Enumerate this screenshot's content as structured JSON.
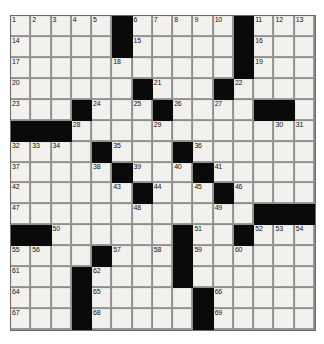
{
  "puzzle": {
    "type": "crossword-grid",
    "rows": 15,
    "cols": 15,
    "cell_fill_color": "#f2f1ee",
    "block_color": "#0a0a0a",
    "grid_line_color": "#8f8f8f",
    "background_color": "#ffffff",
    "max_clue_number": 69,
    "blocks": [
      [
        0,
        5
      ],
      [
        0,
        11
      ],
      [
        1,
        5
      ],
      [
        1,
        11
      ],
      [
        2,
        11
      ],
      [
        3,
        6
      ],
      [
        3,
        10
      ],
      [
        4,
        3
      ],
      [
        4,
        7
      ],
      [
        4,
        12
      ],
      [
        4,
        13
      ],
      [
        5,
        0
      ],
      [
        5,
        1
      ],
      [
        5,
        2
      ],
      [
        6,
        4
      ],
      [
        6,
        8
      ],
      [
        7,
        5
      ],
      [
        7,
        9
      ],
      [
        8,
        6
      ],
      [
        8,
        10
      ],
      [
        9,
        12
      ],
      [
        9,
        13
      ],
      [
        9,
        14
      ],
      [
        10,
        0
      ],
      [
        10,
        1
      ],
      [
        10,
        8
      ],
      [
        10,
        11
      ],
      [
        11,
        4
      ],
      [
        11,
        8
      ],
      [
        12,
        3
      ],
      [
        12,
        8
      ],
      [
        13,
        3
      ],
      [
        13,
        9
      ],
      [
        14,
        3
      ],
      [
        14,
        9
      ]
    ],
    "numbers": [
      {
        "r": 0,
        "c": 0,
        "n": "1"
      },
      {
        "r": 0,
        "c": 1,
        "n": "2"
      },
      {
        "r": 0,
        "c": 2,
        "n": "3"
      },
      {
        "r": 0,
        "c": 3,
        "n": "4"
      },
      {
        "r": 0,
        "c": 4,
        "n": "5"
      },
      {
        "r": 0,
        "c": 6,
        "n": "6"
      },
      {
        "r": 0,
        "c": 7,
        "n": "7"
      },
      {
        "r": 0,
        "c": 8,
        "n": "8"
      },
      {
        "r": 0,
        "c": 9,
        "n": "9"
      },
      {
        "r": 0,
        "c": 10,
        "n": "10"
      },
      {
        "r": 0,
        "c": 12,
        "n": "11"
      },
      {
        "r": 0,
        "c": 13,
        "n": "12"
      },
      {
        "r": 0,
        "c": 14,
        "n": "13"
      },
      {
        "r": 1,
        "c": 0,
        "n": "14"
      },
      {
        "r": 1,
        "c": 6,
        "n": "15"
      },
      {
        "r": 1,
        "c": 12,
        "n": "16"
      },
      {
        "r": 2,
        "c": 0,
        "n": "17"
      },
      {
        "r": 2,
        "c": 5,
        "n": "18"
      },
      {
        "r": 2,
        "c": 12,
        "n": "19"
      },
      {
        "r": 3,
        "c": 0,
        "n": "20"
      },
      {
        "r": 3,
        "c": 7,
        "n": "21"
      },
      {
        "r": 3,
        "c": 11,
        "n": "22"
      },
      {
        "r": 4,
        "c": 0,
        "n": "23"
      },
      {
        "r": 4,
        "c": 4,
        "n": "24"
      },
      {
        "r": 4,
        "c": 6,
        "n": "25"
      },
      {
        "r": 4,
        "c": 8,
        "n": "26"
      },
      {
        "r": 4,
        "c": 10,
        "n": "27"
      },
      {
        "r": 5,
        "c": 3,
        "n": "28"
      },
      {
        "r": 5,
        "c": 7,
        "n": "29"
      },
      {
        "r": 5,
        "c": 13,
        "n": "30"
      },
      {
        "r": 5,
        "c": 14,
        "n": "31"
      },
      {
        "r": 6,
        "c": 0,
        "n": "32"
      },
      {
        "r": 6,
        "c": 1,
        "n": "33"
      },
      {
        "r": 6,
        "c": 2,
        "n": "34"
      },
      {
        "r": 6,
        "c": 5,
        "n": "35"
      },
      {
        "r": 6,
        "c": 9,
        "n": "36"
      },
      {
        "r": 7,
        "c": 0,
        "n": "37"
      },
      {
        "r": 7,
        "c": 4,
        "n": "38"
      },
      {
        "r": 7,
        "c": 6,
        "n": "39"
      },
      {
        "r": 7,
        "c": 8,
        "n": "40"
      },
      {
        "r": 7,
        "c": 10,
        "n": "41"
      },
      {
        "r": 8,
        "c": 0,
        "n": "42"
      },
      {
        "r": 8,
        "c": 5,
        "n": "43"
      },
      {
        "r": 8,
        "c": 7,
        "n": "44"
      },
      {
        "r": 8,
        "c": 9,
        "n": "45"
      },
      {
        "r": 8,
        "c": 11,
        "n": "46"
      },
      {
        "r": 9,
        "c": 0,
        "n": "47"
      },
      {
        "r": 9,
        "c": 6,
        "n": "48"
      },
      {
        "r": 9,
        "c": 10,
        "n": "49"
      },
      {
        "r": 10,
        "c": 2,
        "n": "50"
      },
      {
        "r": 10,
        "c": 9,
        "n": "51"
      },
      {
        "r": 10,
        "c": 12,
        "n": "52"
      },
      {
        "r": 10,
        "c": 13,
        "n": "53"
      },
      {
        "r": 10,
        "c": 14,
        "n": "54"
      },
      {
        "r": 11,
        "c": 0,
        "n": "55"
      },
      {
        "r": 11,
        "c": 1,
        "n": "56"
      },
      {
        "r": 11,
        "c": 5,
        "n": "57"
      },
      {
        "r": 11,
        "c": 7,
        "n": "58"
      },
      {
        "r": 11,
        "c": 9,
        "n": "59"
      },
      {
        "r": 11,
        "c": 11,
        "n": "60"
      },
      {
        "r": 12,
        "c": 0,
        "n": "61"
      },
      {
        "r": 12,
        "c": 4,
        "n": "62"
      },
      {
        "r": 12,
        "c": 8,
        "n": "63"
      },
      {
        "r": 13,
        "c": 0,
        "n": "64"
      },
      {
        "r": 13,
        "c": 4,
        "n": "65"
      },
      {
        "r": 13,
        "c": 10,
        "n": "66"
      },
      {
        "r": 14,
        "c": 0,
        "n": "67"
      },
      {
        "r": 14,
        "c": 4,
        "n": "68"
      },
      {
        "r": 14,
        "c": 10,
        "n": "69"
      }
    ],
    "letters": []
  }
}
